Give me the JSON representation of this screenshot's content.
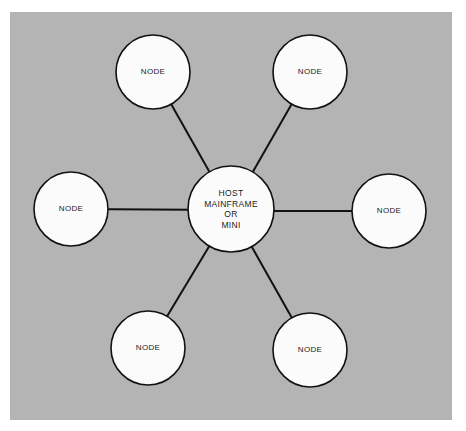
{
  "diagram": {
    "type": "star-network-topology",
    "colors": {
      "background": "#b4b4b4",
      "node_fill": "#fbfbfb",
      "stroke": "#111111"
    },
    "host": {
      "lines": [
        "HOST",
        "MAINFRAME",
        "OR",
        "MINI"
      ],
      "cx": 231,
      "cy": 210,
      "r": 43
    },
    "nodes": [
      {
        "label": "NODE",
        "position": "top-left",
        "cx": 153,
        "cy": 72,
        "r": 37
      },
      {
        "label": "NODE",
        "position": "top-right",
        "cx": 310,
        "cy": 72,
        "r": 37
      },
      {
        "label": "NODE",
        "position": "left",
        "cx": 71,
        "cy": 209,
        "r": 37
      },
      {
        "label": "NODE",
        "position": "right",
        "cx": 389,
        "cy": 211,
        "r": 37
      },
      {
        "label": "NODE",
        "position": "bottom-left",
        "cx": 148,
        "cy": 348,
        "r": 37
      },
      {
        "label": "NODE",
        "position": "bottom-right",
        "cx": 310,
        "cy": 350,
        "r": 37
      }
    ]
  }
}
